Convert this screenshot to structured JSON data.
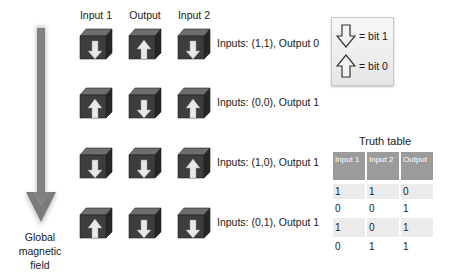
{
  "columns": [
    {
      "label": "Input 1",
      "x": 71
    },
    {
      "label": "Output",
      "x": 120
    },
    {
      "label": "Input 2",
      "x": 169
    }
  ],
  "rows": [
    {
      "top": 28,
      "cubes": [
        "down",
        "up",
        "down"
      ],
      "label": "Inputs: (1,1), Output 0"
    },
    {
      "top": 87,
      "cubes": [
        "up",
        "down",
        "up"
      ],
      "label": "Inputs: (0,0), Output 1"
    },
    {
      "top": 147,
      "cubes": [
        "down",
        "down",
        "up"
      ],
      "label": "Inputs: (1,0), Output 1"
    },
    {
      "top": 207,
      "cubes": [
        "up",
        "down",
        "down"
      ],
      "label": "Inputs: (0,1), Output 1"
    }
  ],
  "field": {
    "label_lines": [
      "Global",
      "magnetic",
      "field"
    ],
    "arrow_direction": "down",
    "arrow_color": "#808080"
  },
  "legend": {
    "items": [
      {
        "icon": "down-arrow-icon",
        "text": "= bit 1"
      },
      {
        "icon": "up-arrow-icon",
        "text": "= bit 0"
      }
    ]
  },
  "truth_table": {
    "title": "Truth table",
    "headers": [
      "Input 1",
      "Input 2",
      "Output"
    ],
    "rows": [
      [
        "1",
        "1",
        "0"
      ],
      [
        "0",
        "0",
        "1"
      ],
      [
        "1",
        "0",
        "1"
      ],
      [
        "0",
        "1",
        "1"
      ]
    ],
    "header_color": "#9b9b9b",
    "stripe_color": "#ebebeb"
  },
  "colors": {
    "cube_front": "#3d3d3d",
    "cube_top": "#6e6e6e",
    "cube_side": "#262626",
    "arrow_fill": "#e8e8e8"
  }
}
